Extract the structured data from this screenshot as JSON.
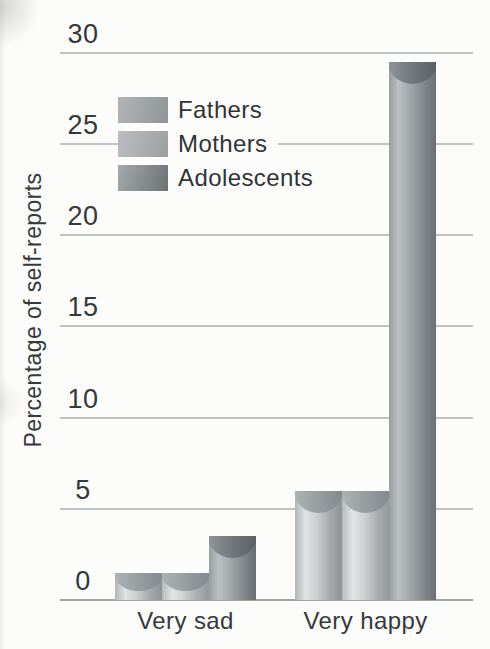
{
  "chart_data": {
    "type": "bar",
    "title": "",
    "xlabel": "",
    "ylabel": "Percentage of self-reports",
    "categories": [
      "Very sad",
      "Very happy"
    ],
    "series": [
      {
        "name": "Fathers",
        "values": [
          1.5,
          6
        ]
      },
      {
        "name": "Mothers",
        "values": [
          1.5,
          6
        ]
      },
      {
        "name": "Adolescents",
        "values": [
          3.5,
          29.5
        ]
      }
    ],
    "ylim": [
      0,
      30
    ],
    "yticks": [
      0,
      5,
      10,
      15,
      20,
      25,
      30
    ],
    "grid": "horizontal",
    "legend_position": "upper-left-inside",
    "bar_style": "shaded-cylinder"
  },
  "legend": {
    "items": [
      {
        "label": "Fathers"
      },
      {
        "label": "Mothers"
      },
      {
        "label": "Adolescents"
      }
    ]
  },
  "colors": {
    "background": "#fcfcfb",
    "text": "#36393b",
    "gridline": "#b5b8b9",
    "baseline": "#9fa3a5",
    "fathers_light": "#dfe1e2",
    "fathers_dark": "#8d9294",
    "mothers_light": "#e2e4e5",
    "mothers_dark": "#939899",
    "adolescents_light": "#bcc0c2",
    "adolescents_dark": "#696f72"
  }
}
